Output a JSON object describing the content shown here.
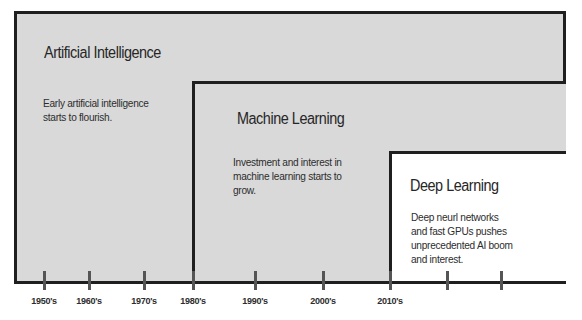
{
  "diagram": {
    "type": "nested-timeline",
    "regions": [
      {
        "id": "ai",
        "title": "Artificial Intelligence",
        "description_lines": [
          "Early artificial intelligence",
          "starts to flourish."
        ],
        "start": "1950's",
        "fill": "#d9d9d9"
      },
      {
        "id": "ml",
        "title": "Machine Learning",
        "description_lines": [
          "Investment and interest in",
          "machine learning starts to",
          "grow."
        ],
        "start": "1980's",
        "fill": "#d9d9d9"
      },
      {
        "id": "dl",
        "title": "Deep Learning",
        "description_lines": [
          "Deep neurl networks",
          "and fast GPUs pushes",
          "unprecedented AI boom",
          "and interest."
        ],
        "start": "2010's",
        "fill": "#ffffff"
      }
    ],
    "timeline": {
      "ticks": [
        {
          "label": "1950's",
          "x": 44
        },
        {
          "label": "1960's",
          "x": 89
        },
        {
          "label": "1970's",
          "x": 144
        },
        {
          "label": "1980's",
          "x": 193
        },
        {
          "label": "1990's",
          "x": 255
        },
        {
          "label": "2000's",
          "x": 323
        },
        {
          "label": "2010's",
          "x": 390
        },
        {
          "label": "",
          "x": 447
        },
        {
          "label": "",
          "x": 501
        }
      ]
    },
    "colors": {
      "border": "#1f1f1f",
      "gray_fill": "#d9d9d9",
      "tick": "#555555",
      "text": "#2a2a2a"
    }
  }
}
